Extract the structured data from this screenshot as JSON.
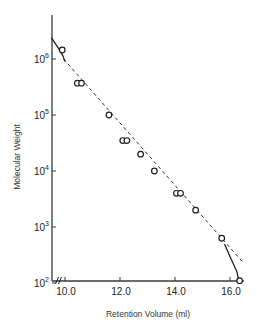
{
  "chart_data": {
    "type": "scatter",
    "title": "",
    "xlabel": "Retention Volume (ml)",
    "ylabel": "Molecular Weight",
    "xscale": "linear",
    "yscale": "log",
    "xlim": [
      9.5,
      16.5
    ],
    "ylim": [
      100,
      4000000
    ],
    "x_ticks": [
      10.0,
      12.0,
      14.0,
      16.0
    ],
    "x_tick_labels": [
      "10.0",
      "12.0",
      "14.0",
      "16.0"
    ],
    "y_ticks": [
      100,
      1000,
      10000,
      100000,
      1000000
    ],
    "y_tick_labels": [
      {
        "base": "10",
        "exp": "2"
      },
      {
        "base": "10",
        "exp": "3"
      },
      {
        "base": "10",
        "exp": "4"
      },
      {
        "base": "10",
        "exp": "5"
      },
      {
        "base": "10",
        "exp": "6"
      }
    ],
    "x_axis_break": true,
    "grid": false,
    "legend": null,
    "series": [
      {
        "name": "Calibration standards",
        "marker": "open-circle",
        "points": [
          {
            "x": 9.9,
            "y": 1450000
          },
          {
            "x": 10.45,
            "y": 370000
          },
          {
            "x": 10.6,
            "y": 370000
          },
          {
            "x": 11.6,
            "y": 100000
          },
          {
            "x": 12.1,
            "y": 35000
          },
          {
            "x": 12.25,
            "y": 35000
          },
          {
            "x": 12.75,
            "y": 20000
          },
          {
            "x": 13.25,
            "y": 10000
          },
          {
            "x": 14.05,
            "y": 4000
          },
          {
            "x": 14.2,
            "y": 4000
          },
          {
            "x": 14.75,
            "y": 2000
          },
          {
            "x": 15.7,
            "y": 630
          },
          {
            "x": 16.35,
            "y": 110
          }
        ]
      },
      {
        "name": "Linear fit",
        "style": "dashed",
        "points": [
          {
            "x": 9.95,
            "y": 1000000
          },
          {
            "x": 16.45,
            "y": 240
          }
        ]
      },
      {
        "name": "Exclusion limit curve",
        "style": "solid",
        "points": [
          {
            "x": 9.5,
            "y": 2400000
          },
          {
            "x": 9.75,
            "y": 1600000
          },
          {
            "x": 9.92,
            "y": 1150000
          },
          {
            "x": 10.0,
            "y": 900000
          }
        ]
      },
      {
        "name": "Total permeation curve",
        "style": "solid",
        "points": [
          {
            "x": 15.8,
            "y": 500.0
          },
          {
            "x": 16.05,
            "y": 260
          },
          {
            "x": 16.25,
            "y": 160
          },
          {
            "x": 16.33,
            "y": 105
          }
        ]
      }
    ]
  },
  "layout": {
    "plot": {
      "x0": 52,
      "y_axis_top": 15,
      "x_axis_y": 281,
      "x_axis_end": 244
    },
    "x_map": {
      "v0": 10.0,
      "px0": 65,
      "px_per_unit": 27.5
    },
    "y_map": {
      "logv0": 6,
      "px0": 59,
      "px_per_decade": 56
    },
    "colors": {
      "axis": "#3a3a3a",
      "ink": "#1e1e1e",
      "dash": "#333333"
    }
  }
}
